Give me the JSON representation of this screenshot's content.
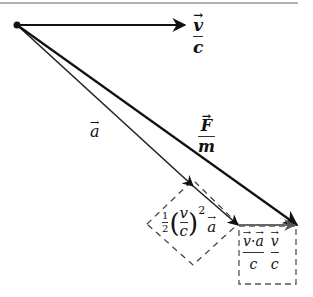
{
  "diagram": {
    "colors": {
      "primary": "#111111",
      "secondary": "#555555",
      "dashed": "#444444",
      "top_rule": "#999999"
    },
    "points": {
      "origin": [
        17,
        25
      ],
      "v_over_c_tip": [
        185,
        25
      ],
      "a_mid_arrow": [
        193,
        186
      ],
      "a_tip": [
        238,
        225
      ],
      "F_over_m_tip": [
        297,
        225
      ]
    },
    "vectors": [
      {
        "id": "v_over_c",
        "label_num": "v",
        "label_den": "c",
        "from": [
          17,
          25
        ],
        "to": [
          185,
          25
        ]
      },
      {
        "id": "a",
        "label": "a",
        "from": [
          17,
          25
        ],
        "to": [
          238,
          225
        ]
      },
      {
        "id": "F_over_m",
        "label_num": "F",
        "label_den": "m",
        "from": [
          17,
          25
        ],
        "to": [
          297,
          225
        ]
      },
      {
        "id": "correction",
        "from": [
          238,
          225
        ],
        "to": [
          297,
          225
        ]
      }
    ],
    "labels": {
      "v_over_c": {
        "num": "v",
        "den": "c"
      },
      "a": "a",
      "F_over_m": {
        "num": "F",
        "den": "m"
      },
      "half_term": {
        "half_num": "1",
        "half_den": "2",
        "paren_num": "v",
        "paren_den": "c",
        "exponent": "2",
        "vector": "a"
      },
      "box_term": {
        "t1_num_v": "v",
        "t1_dot": "·",
        "t1_num_a": "a",
        "t1_den": "c",
        "t2_num": "v",
        "t2_den": "c"
      }
    }
  }
}
